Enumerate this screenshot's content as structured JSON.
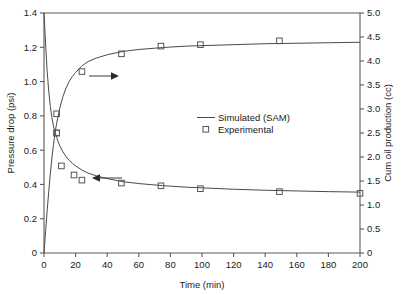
{
  "chart_data": {
    "type": "line",
    "title": "",
    "subtitle": "",
    "xlabel": "Time (min)",
    "ylabel": "Pressure drop (psi)",
    "y2label": "Cum oil production (cc)",
    "xlim": [
      0,
      200
    ],
    "ylim": [
      0,
      1.4
    ],
    "y2lim": [
      0,
      5.0
    ],
    "xticks": [
      0,
      20,
      40,
      60,
      80,
      100,
      120,
      140,
      160,
      180,
      200
    ],
    "xticklabels": [
      "0",
      "20",
      "40",
      "60",
      "80",
      "100",
      "120",
      "140",
      "160",
      "180",
      "200"
    ],
    "yticks": [
      0,
      0.2,
      0.4,
      0.6,
      0.8,
      1.0,
      1.2,
      1.4
    ],
    "yticklabels": [
      "0",
      "0.2",
      "0.4",
      "0.6",
      "0.8",
      "1.0",
      "1.2",
      "1.4"
    ],
    "y2ticks": [
      0,
      0.5,
      1.0,
      1.5,
      2.0,
      2.5,
      3.0,
      3.5,
      4.0,
      4.5,
      5.0
    ],
    "y2ticklabels": [
      "0",
      "0.5",
      "1.0",
      "1.5",
      "2.0",
      "2.5",
      "3.0",
      "3.5",
      "4.0",
      "4.5",
      "5.0"
    ],
    "grid": false,
    "legend_position": "center",
    "legend": [
      {
        "label": "Simulated (SAM)",
        "marker": "line"
      },
      {
        "label": "Experimental",
        "marker": "open-square"
      }
    ],
    "annotations": [
      {
        "name": "arrow-to-right-axis",
        "direction": "right",
        "x_start": 33,
        "x_end": 50,
        "y_axis": "right",
        "y_value": 3.74
      },
      {
        "name": "arrow-to-left-axis",
        "direction": "left",
        "x_start": 43,
        "x_end": 29,
        "y_axis": "left",
        "y_value": 0.405
      }
    ],
    "series": [
      {
        "name": "Simulated (SAM) - Pressure drop",
        "axis": "left",
        "type": "line",
        "x": [
          0,
          1,
          2,
          3,
          4,
          5,
          6,
          7,
          8,
          9,
          10,
          12,
          14,
          16,
          18,
          20,
          24,
          28,
          33,
          40,
          50,
          60,
          75,
          90,
          100,
          120,
          140,
          160,
          180,
          200
        ],
        "y": [
          1.4,
          1.22,
          1.06,
          0.945,
          0.855,
          0.79,
          0.74,
          0.705,
          0.675,
          0.648,
          0.625,
          0.59,
          0.562,
          0.54,
          0.523,
          0.508,
          0.484,
          0.466,
          0.45,
          0.434,
          0.416,
          0.405,
          0.393,
          0.384,
          0.38,
          0.372,
          0.366,
          0.362,
          0.358,
          0.355
        ]
      },
      {
        "name": "Simulated (SAM) - Cum oil production",
        "axis": "right",
        "type": "line",
        "x": [
          0,
          1,
          2,
          3,
          4,
          5,
          6,
          7,
          8,
          10,
          12,
          14,
          16,
          18,
          20,
          24,
          28,
          33,
          40,
          50,
          60,
          75,
          90,
          100,
          120,
          140,
          160,
          180,
          200
        ],
        "y": [
          0,
          0.45,
          0.88,
          1.28,
          1.65,
          1.98,
          2.26,
          2.5,
          2.7,
          3.02,
          3.26,
          3.44,
          3.58,
          3.68,
          3.76,
          3.9,
          3.99,
          4.06,
          4.13,
          4.2,
          4.24,
          4.28,
          4.31,
          4.32,
          4.34,
          4.36,
          4.37,
          4.38,
          4.39
        ]
      },
      {
        "name": "Experimental - Pressure drop",
        "axis": "left",
        "type": "scatter",
        "marker": "open-square",
        "x": [
          8,
          11,
          19,
          24,
          49,
          74,
          99,
          149,
          200
        ],
        "y": [
          0.7,
          0.508,
          0.455,
          0.425,
          0.408,
          0.392,
          0.375,
          0.358,
          0.348
        ]
      },
      {
        "name": "Experimental - Cum oil production",
        "axis": "right",
        "type": "scatter",
        "marker": "open-square",
        "x": [
          8,
          8,
          24,
          49,
          74,
          99,
          149
        ],
        "y": [
          2.9,
          2.5,
          3.78,
          4.15,
          4.31,
          4.34,
          4.42
        ]
      }
    ]
  },
  "colors": {
    "curve": "#4a4a4a",
    "marker": "#555555",
    "axis": "#5a5a5a",
    "text": "#1a1a1a",
    "background": "#ffffff"
  }
}
